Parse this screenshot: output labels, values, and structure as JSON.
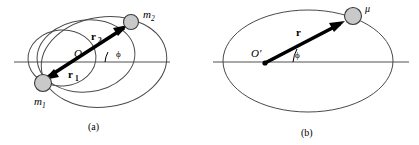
{
  "figure": {
    "type": "physics-diagram",
    "colors": {
      "curve_stroke": "#4a4a4a",
      "axis_stroke": "#8a8a8a",
      "body_fill": "#c9c9c9",
      "body_stroke": "#3a3a3a",
      "vector": "#000000",
      "background": "#ffffff"
    },
    "panels": [
      {
        "id": "a",
        "caption": "(a)",
        "labels": {
          "mass1": "m",
          "mass1_sub": "1",
          "mass2": "m",
          "mass2_sub": "2",
          "origin": "O",
          "vector1": "r",
          "vector1_sub": "1",
          "vector2": "r",
          "vector2_sub": "2",
          "angle": "ϕ"
        }
      },
      {
        "id": "b",
        "caption": "(b)",
        "labels": {
          "reduced_mass": "μ",
          "origin": "O′",
          "vector": "r",
          "angle": "ϕ"
        }
      }
    ]
  }
}
